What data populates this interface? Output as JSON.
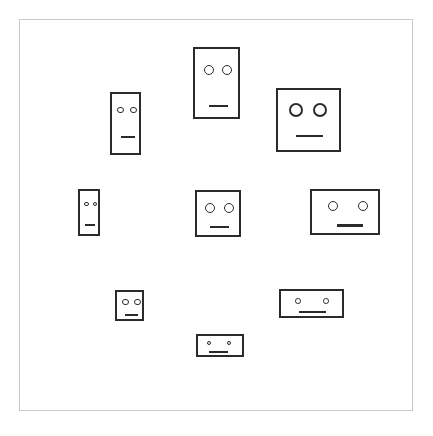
{
  "scene": {
    "title": "Nine schematic rectangular faces",
    "canvas_width": 433,
    "canvas_height": 436,
    "background_color": "#ffffff",
    "stroke_color": "#2b2b2b",
    "frame_color": "#c9c9c9"
  },
  "frame": {
    "label": "outer frame",
    "x": 19,
    "y": 19,
    "width": 394,
    "height": 392,
    "border_width": 1.5
  },
  "faces": [
    {
      "id": "face-top-left",
      "label": "tall narrow face, top left",
      "x": 110,
      "y": 92,
      "width": 31,
      "height": 63,
      "border_width": 2,
      "eyes": [
        {
          "cx": 8.5,
          "cy": 16,
          "r": 3.2,
          "border": 1.6
        },
        {
          "cx": 21.5,
          "cy": 16,
          "r": 3.2,
          "border": 1.6
        }
      ],
      "mouth": {
        "x": 9,
        "y": 42,
        "width": 14,
        "height": 2.2
      }
    },
    {
      "id": "face-top-center",
      "label": "large tall face, top center",
      "x": 193,
      "y": 47,
      "width": 47,
      "height": 72,
      "border_width": 2,
      "eyes": [
        {
          "cx": 14,
          "cy": 21,
          "r": 5.2,
          "border": 1.8
        },
        {
          "cx": 32,
          "cy": 21,
          "r": 5.2,
          "border": 1.8
        }
      ],
      "mouth": {
        "x": 14,
        "y": 56,
        "width": 19,
        "height": 2.4
      }
    },
    {
      "id": "face-top-right",
      "label": "large square face, top right",
      "x": 276,
      "y": 88,
      "width": 65,
      "height": 64,
      "border_width": 2,
      "eyes": [
        {
          "cx": 18,
          "cy": 20,
          "r": 7.0,
          "border": 2.0
        },
        {
          "cx": 42,
          "cy": 20,
          "r": 7.0,
          "border": 2.0
        }
      ],
      "mouth": {
        "x": 18,
        "y": 45,
        "width": 27,
        "height": 2.4
      }
    },
    {
      "id": "face-middle-left",
      "label": "small narrow face, middle left",
      "x": 78,
      "y": 189,
      "width": 22,
      "height": 47,
      "border_width": 2,
      "eyes": [
        {
          "cx": 6.5,
          "cy": 13,
          "r": 2.3,
          "border": 1.4
        },
        {
          "cx": 15.0,
          "cy": 13,
          "r": 2.3,
          "border": 1.4
        }
      ],
      "mouth": {
        "x": 5,
        "y": 33,
        "width": 10,
        "height": 2.0
      }
    },
    {
      "id": "face-middle-center",
      "label": "medium square face, middle center",
      "x": 195,
      "y": 190,
      "width": 46,
      "height": 47,
      "border_width": 2,
      "eyes": [
        {
          "cx": 13,
          "cy": 16,
          "r": 5.0,
          "border": 1.8
        },
        {
          "cx": 32,
          "cy": 16,
          "r": 5.0,
          "border": 1.8
        }
      ],
      "mouth": {
        "x": 13,
        "y": 34,
        "width": 19,
        "height": 2.4
      }
    },
    {
      "id": "face-middle-right",
      "label": "wide face, middle right",
      "x": 310,
      "y": 189,
      "width": 70,
      "height": 46,
      "border_width": 2,
      "eyes": [
        {
          "cx": 21,
          "cy": 15,
          "r": 5.0,
          "border": 1.8
        },
        {
          "cx": 51,
          "cy": 15,
          "r": 5.0,
          "border": 1.8
        }
      ],
      "mouth": {
        "x": 25,
        "y": 33,
        "width": 26,
        "height": 2.6
      }
    },
    {
      "id": "face-bottom-left",
      "label": "small square face, bottom left",
      "x": 115,
      "y": 290,
      "width": 29,
      "height": 31,
      "border_width": 2,
      "eyes": [
        {
          "cx": 8.5,
          "cy": 10,
          "r": 3.2,
          "border": 1.6
        },
        {
          "cx": 20.5,
          "cy": 10,
          "r": 3.2,
          "border": 1.6
        }
      ],
      "mouth": {
        "x": 8,
        "y": 22,
        "width": 13,
        "height": 2.2
      }
    },
    {
      "id": "face-bottom-right",
      "label": "wide flat face, bottom right",
      "x": 279,
      "y": 289,
      "width": 65,
      "height": 29,
      "border_width": 2,
      "eyes": [
        {
          "cx": 17,
          "cy": 10,
          "r": 2.8,
          "border": 1.5
        },
        {
          "cx": 45,
          "cy": 10,
          "r": 2.8,
          "border": 1.5
        }
      ],
      "mouth": {
        "x": 18,
        "y": 20,
        "width": 27,
        "height": 2.4
      }
    },
    {
      "id": "face-bottom-center",
      "label": "small wide face, bottom center",
      "x": 196,
      "y": 334,
      "width": 48,
      "height": 23,
      "border_width": 2,
      "eyes": [
        {
          "cx": 11,
          "cy": 7,
          "r": 2.2,
          "border": 1.3
        },
        {
          "cx": 31,
          "cy": 7,
          "r": 2.2,
          "border": 1.3
        }
      ],
      "mouth": {
        "x": 11,
        "y": 15,
        "width": 19,
        "height": 2.2
      }
    }
  ]
}
